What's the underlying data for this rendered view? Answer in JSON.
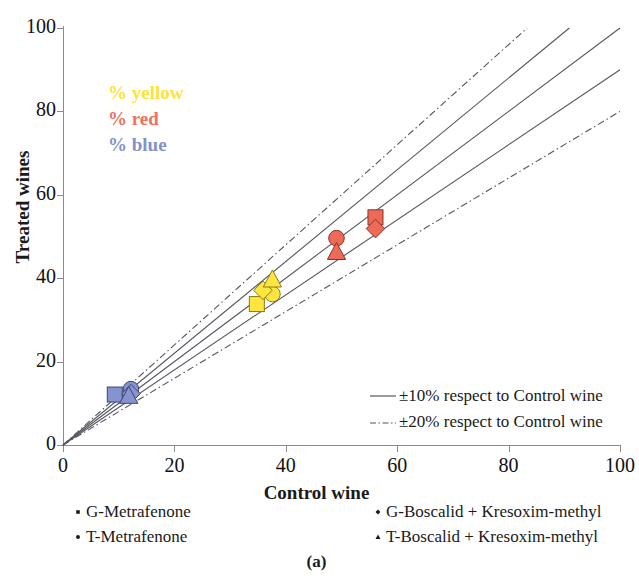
{
  "caption": "(a)",
  "chart_data": {
    "type": "scatter",
    "title": "",
    "xlabel": "Control wine",
    "ylabel": "Treated wines",
    "xlim": [
      0,
      100
    ],
    "ylim": [
      0,
      100
    ],
    "xticks": [
      0,
      20,
      40,
      60,
      80,
      100
    ],
    "yticks": [
      0,
      20,
      40,
      60,
      80,
      100
    ],
    "grid": false,
    "legend_position": "bottom",
    "color_annotations": [
      {
        "label": "% yellow",
        "color": "#FFE13B"
      },
      {
        "label": "% red",
        "color": "#F1705E"
      },
      {
        "label": "% blue",
        "color": "#8491C8"
      }
    ],
    "reference_lines": [
      {
        "name": "+20%",
        "slope": 1.2,
        "style": "dashdot",
        "color": "#55555f"
      },
      {
        "name": "+10%",
        "slope": 1.1,
        "style": "solid",
        "color": "#55555f"
      },
      {
        "name": "1:1",
        "slope": 1.0,
        "style": "solid",
        "color": "#55555f"
      },
      {
        "name": "-10%",
        "slope": 0.9,
        "style": "solid",
        "color": "#55555f"
      },
      {
        "name": "-20%",
        "slope": 0.8,
        "style": "dashdot",
        "color": "#55555f"
      }
    ],
    "line_legend": [
      {
        "label": "±10% respect to Control wine",
        "style": "solid"
      },
      {
        "label": "±20% respect to Control wine",
        "style": "dashdot"
      }
    ],
    "marker_legend": [
      {
        "label": "G-Metrafenone",
        "marker": "square"
      },
      {
        "label": "T-Metrafenone",
        "marker": "circle"
      },
      {
        "label": "G-Boscalid + Kresoxim-methyl",
        "marker": "diamond"
      },
      {
        "label": "T-Boscalid + Kresoxim-methyl",
        "marker": "triangle"
      }
    ],
    "series": [
      {
        "name": "% yellow",
        "color": "#FFE53F",
        "edge": "#8a7a17",
        "points": [
          {
            "marker": "square",
            "label": "G-Metrafenone",
            "x": 34.8,
            "y": 33.8
          },
          {
            "marker": "circle",
            "label": "T-Metrafenone",
            "x": 37.6,
            "y": 36.2
          },
          {
            "marker": "diamond",
            "label": "G-Boscalid + Kresoxim-methyl",
            "x": 35.9,
            "y": 37.1
          },
          {
            "marker": "triangle",
            "label": "T-Boscalid + Kresoxim-methyl",
            "x": 37.6,
            "y": 39.6
          }
        ]
      },
      {
        "name": "% red",
        "color": "#EE6A56",
        "edge": "#8c3124",
        "points": [
          {
            "marker": "square",
            "label": "G-Metrafenone",
            "x": 56.1,
            "y": 54.6
          },
          {
            "marker": "circle",
            "label": "T-Metrafenone",
            "x": 49.1,
            "y": 49.6
          },
          {
            "marker": "diamond",
            "label": "G-Boscalid + Kresoxim-methyl",
            "x": 56.1,
            "y": 51.9
          },
          {
            "marker": "triangle",
            "label": "T-Boscalid + Kresoxim-methyl",
            "x": 49.1,
            "y": 46.2
          }
        ]
      },
      {
        "name": "% blue",
        "color": "#8793CE",
        "edge": "#3c4474",
        "points": [
          {
            "marker": "square",
            "label": "G-Metrafenone",
            "x": 9.3,
            "y": 12.1
          },
          {
            "marker": "circle",
            "label": "T-Metrafenone",
            "x": 12.2,
            "y": 13.4
          },
          {
            "marker": "diamond",
            "label": "G-Boscalid + Kresoxim-methyl",
            "x": 12.2,
            "y": 12.3
          },
          {
            "marker": "triangle",
            "label": "T-Boscalid + Kresoxim-methyl",
            "x": 11.8,
            "y": 11.7
          }
        ]
      }
    ]
  }
}
